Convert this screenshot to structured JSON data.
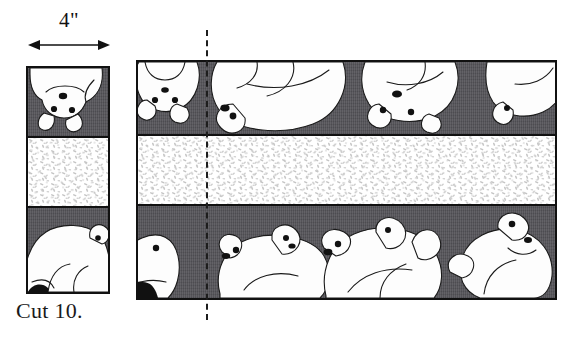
{
  "figure": {
    "type": "quilting-cutting-diagram",
    "title_text": "",
    "dimension": {
      "label": "4\"",
      "axis": "horizontal",
      "icon": "double-headed-arrow"
    },
    "caption": "Cut 10.",
    "cut_line": {
      "style": "dashed",
      "orientation": "vertical",
      "x_px": 207
    },
    "colors": {
      "dark_band": "#555459",
      "speckle_band": "#ffffff",
      "speckle_dot": "#c9c9c9",
      "outline": "#111111",
      "bear_fill": "#fdfdfd",
      "paper": "#ffffff"
    },
    "strip_panel": {
      "name": "cut-strip",
      "width_label": "4\"",
      "bands": [
        {
          "kind": "dark",
          "motif": "polar-bear-print",
          "orientation": "inverted"
        },
        {
          "kind": "speckle",
          "motif": "snow-speckle-print",
          "orientation": "upright"
        },
        {
          "kind": "dark",
          "motif": "polar-bear-print",
          "orientation": "upright"
        }
      ]
    },
    "main_panel": {
      "name": "fabric-yardage",
      "bands": [
        {
          "kind": "dark",
          "motif": "polar-bear-print",
          "orientation": "inverted",
          "bear_count": 4
        },
        {
          "kind": "speckle",
          "motif": "snow-speckle-print",
          "orientation": "upright",
          "bear_count": 0
        },
        {
          "kind": "dark",
          "motif": "polar-bear-print",
          "orientation": "upright",
          "bear_count": 5
        }
      ]
    }
  }
}
